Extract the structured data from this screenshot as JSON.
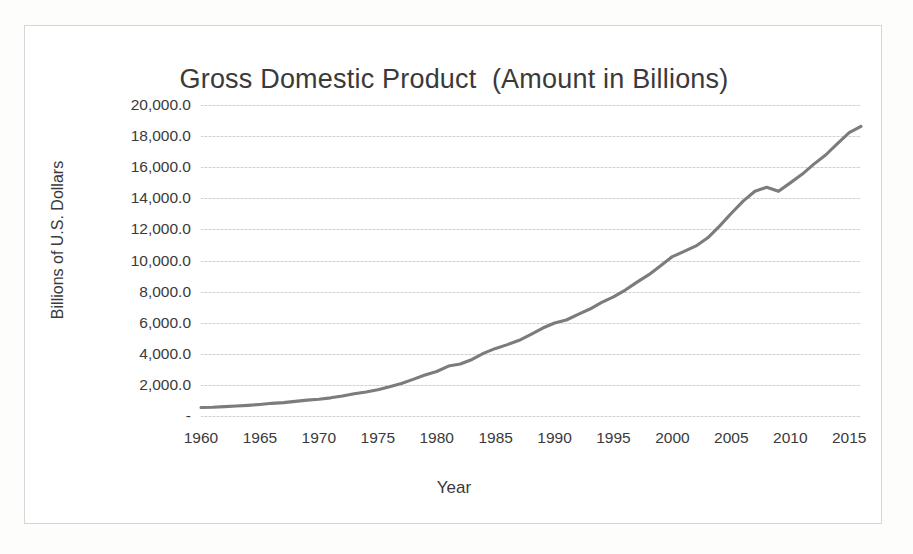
{
  "chart_data": {
    "type": "line",
    "title": "Gross Domestic Product  (Amount in Billions)",
    "xlabel": "Year",
    "ylabel": "Billions of U.S. Dollars",
    "xlim": [
      1960,
      2016
    ],
    "ylim": [
      0,
      20000
    ],
    "grid": true,
    "legend": "none",
    "line_color": "#7c7c7c",
    "gridline_color": "#d9d9d9",
    "frame_color": "#d6d6d6",
    "y_tick_labels": [
      "20,000.0",
      "18,000.0",
      "16,000.0",
      "14,000.0",
      "12,000.0",
      "10,000.0",
      "8,000.0",
      "6,000.0",
      "4,000.0",
      "2,000.0",
      "-"
    ],
    "y_tick_values": [
      20000,
      18000,
      16000,
      14000,
      12000,
      10000,
      8000,
      6000,
      4000,
      2000,
      0
    ],
    "x_tick_labels": [
      "1960",
      "1965",
      "1970",
      "1975",
      "1980",
      "1985",
      "1990",
      "1995",
      "2000",
      "2005",
      "2010",
      "2015"
    ],
    "x_tick_values": [
      1960,
      1965,
      1970,
      1975,
      1980,
      1985,
      1990,
      1995,
      2000,
      2005,
      2010,
      2015
    ],
    "series": [
      {
        "name": "Gross Domestic Product",
        "x": [
          1960,
          1961,
          1962,
          1963,
          1964,
          1965,
          1966,
          1967,
          1968,
          1969,
          1970,
          1971,
          1972,
          1973,
          1974,
          1975,
          1976,
          1977,
          1978,
          1979,
          1980,
          1981,
          1982,
          1983,
          1984,
          1985,
          1986,
          1987,
          1988,
          1989,
          1990,
          1991,
          1992,
          1993,
          1994,
          1995,
          1996,
          1997,
          1998,
          1999,
          2000,
          2001,
          2002,
          2003,
          2004,
          2005,
          2006,
          2007,
          2008,
          2009,
          2010,
          2011,
          2012,
          2013,
          2014,
          2015,
          2016
        ],
        "values": [
          543.3,
          563.3,
          605.1,
          638.6,
          685.8,
          743.7,
          815.0,
          861.7,
          942.5,
          1019.9,
          1075.9,
          1167.8,
          1282.4,
          1428.5,
          1548.8,
          1688.9,
          1877.6,
          2086.0,
          2356.6,
          2632.1,
          2862.5,
          3211.0,
          3345.0,
          3638.1,
          4040.7,
          4346.7,
          4590.2,
          4870.2,
          5252.6,
          5657.7,
          5979.6,
          6174.0,
          6539.3,
          6878.7,
          7308.8,
          7664.1,
          8100.2,
          8608.5,
          9089.2,
          9660.6,
          10252.3,
          10581.8,
          10936.4,
          11458.2,
          12213.7,
          13036.6,
          13814.6,
          14451.9,
          14712.8,
          14448.9,
          14992.1,
          15542.6,
          16197.0,
          16784.9,
          17521.7,
          18219.3,
          18624.5
        ]
      }
    ]
  }
}
